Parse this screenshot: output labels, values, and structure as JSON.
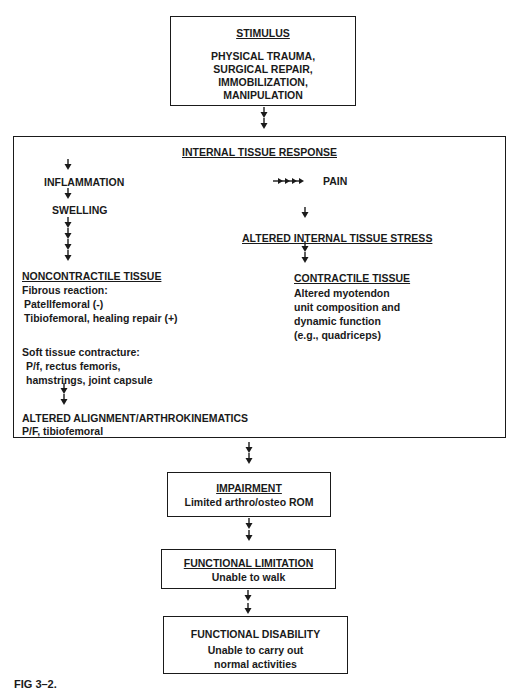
{
  "stimulus": {
    "title": "STIMULUS",
    "lines": [
      "PHYSICAL TRAUMA,",
      "SURGICAL REPAIR,",
      "IMMOBILIZATION,",
      "MANIPULATION"
    ]
  },
  "internal": {
    "title": "INTERNAL TISSUE RESPONSE",
    "inflammation": "INFLAMMATION",
    "swelling": "SWELLING",
    "pain": "PAIN",
    "altered_stress": "ALTERED INTERNAL TISSUE STRESS",
    "noncontractile": {
      "title": "NONCONTRACTILE TISSUE",
      "fibrous_label": "Fibrous reaction:",
      "fibrous_items": [
        "Patellfemoral (-)",
        "Tibiofemoral, healing repair (+)"
      ],
      "soft_label": "Soft tissue contracture:",
      "soft_items": [
        "P/f, rectus femoris,",
        "hamstrings, joint capsule"
      ]
    },
    "contractile": {
      "title": "CONTRACTILE TISSUE",
      "lines": [
        "Altered myotendon",
        "unit composition and",
        "dynamic function",
        "(e.g., quadriceps)"
      ]
    },
    "alignment": {
      "title": "ALTERED ALIGNMENT/ARTHROKINEMATICS",
      "sub": "P/F, tibiofemoral"
    }
  },
  "impairment": {
    "title": "IMPAIRMENT",
    "desc": "Limited arthro/osteo ROM"
  },
  "limitation": {
    "title": "FUNCTIONAL LIMITATION",
    "desc": "Unable to walk"
  },
  "disability": {
    "title": "FUNCTIONAL DISABILITY",
    "lines": [
      "Unable to carry out",
      "normal activities"
    ]
  },
  "caption": "FIG 3–2."
}
